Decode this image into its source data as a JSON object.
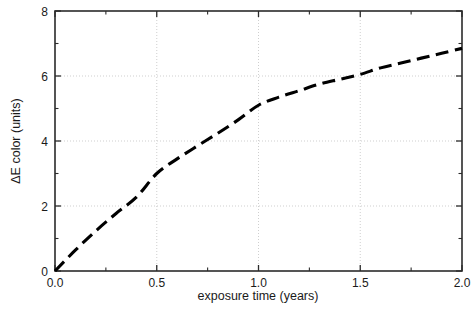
{
  "chart_data": {
    "type": "line",
    "title": "",
    "subtitle": "",
    "xlabel": "exposure time (years)",
    "ylabel": "ΔE color (units)",
    "xlim": [
      0.0,
      2.0
    ],
    "ylim": [
      0,
      8
    ],
    "xticks": [
      0.0,
      0.5,
      1.0,
      1.5,
      2.0
    ],
    "xtick_labels": [
      "0.0",
      "0.5",
      "1.0",
      "1.5",
      "2.0"
    ],
    "xminor_ticks": [
      0.25,
      0.75,
      1.25,
      1.75
    ],
    "yticks": [
      0,
      2,
      4,
      6,
      8
    ],
    "ytick_labels": [
      "0",
      "2",
      "4",
      "6",
      "8"
    ],
    "yminor_ticks": [
      1,
      3,
      5,
      7
    ],
    "grid": true,
    "grid_style": "dotted",
    "grid_color": "#c9c9c9",
    "legend": null,
    "series": [
      {
        "name": "ΔE color",
        "style": "dashed",
        "color": "#000000",
        "line_width": 3,
        "x": [
          0.0,
          0.1,
          0.2,
          0.3,
          0.4,
          0.5,
          0.6,
          0.7,
          0.8,
          0.9,
          1.0,
          1.1,
          1.2,
          1.3,
          1.4,
          1.5,
          1.6,
          1.7,
          1.8,
          1.9,
          2.0
        ],
        "values": [
          0.0,
          0.64,
          1.23,
          1.77,
          2.27,
          3.0,
          3.45,
          3.85,
          4.24,
          4.65,
          5.1,
          5.35,
          5.55,
          5.75,
          5.9,
          6.05,
          6.25,
          6.4,
          6.55,
          6.7,
          6.85
        ]
      }
    ],
    "annotations": []
  },
  "axes": {
    "x_axis_label": "exposure time (years)",
    "y_axis_label": "ΔE color (units)",
    "x_tick_labels": [
      "0.0",
      "0.5",
      "1.0",
      "1.5",
      "2.0"
    ],
    "y_tick_labels": [
      "0",
      "2",
      "4",
      "6",
      "8"
    ]
  }
}
